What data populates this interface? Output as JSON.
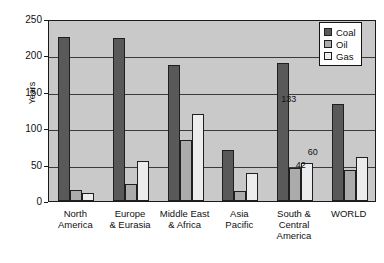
{
  "chart_data": {
    "type": "bar",
    "title": "",
    "subtitle": "",
    "xlabel": "",
    "ylabel": "Years",
    "ylim": [
      0,
      250
    ],
    "yticks": [
      0,
      50,
      100,
      150,
      200,
      250
    ],
    "ytick_labels": [
      "0",
      "50",
      "100",
      "150",
      "200",
      "250"
    ],
    "grid": true,
    "legend_position": "top-right",
    "categories": [
      "North\nAmerica",
      "Europe\n& Eurasia",
      "Middle East\n& Africa",
      "Asia\nPacific",
      "South &\nCentral\nAmerica",
      "WORLD"
    ],
    "series": [
      {
        "name": "Coal",
        "color": "#595959",
        "values": [
          225,
          224,
          187,
          70,
          190,
          133
        ]
      },
      {
        "name": "Oil",
        "color": "#ababab",
        "values": [
          15,
          23,
          84,
          14,
          46,
          42
        ]
      },
      {
        "name": "Gas",
        "color": "#ececec",
        "values": [
          11,
          55,
          120,
          38,
          52,
          60
        ]
      }
    ],
    "data_labels": [
      {
        "category_index": 5,
        "series_index": 0,
        "text": "133"
      },
      {
        "category_index": 5,
        "series_index": 1,
        "text": "42"
      },
      {
        "category_index": 5,
        "series_index": 2,
        "text": "60"
      }
    ],
    "plot_background": "#c9c9c9",
    "page_background": "#ffffff"
  },
  "legend": {
    "items": [
      {
        "label": "Coal"
      },
      {
        "label": "Oil"
      },
      {
        "label": "Gas"
      }
    ]
  }
}
